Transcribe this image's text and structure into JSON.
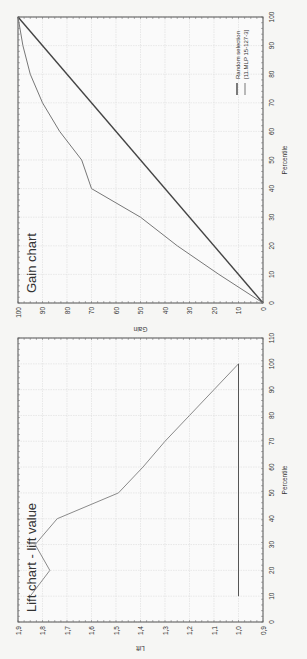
{
  "chart_data": [
    {
      "type": "line",
      "title": "Lift chart - lift value",
      "xlabel": "Percentile",
      "ylabel": "Lift",
      "xlim": [
        0,
        110
      ],
      "ylim": [
        0.9,
        1.9
      ],
      "x_ticks": [
        "0",
        "10",
        "20",
        "30",
        "40",
        "50",
        "60",
        "70",
        "80",
        "90",
        "100",
        "110"
      ],
      "y_ticks": [
        "0,9",
        "1,0",
        "1,1",
        "1,2",
        "1,3",
        "1,4",
        "1,5",
        "1,6",
        "1,7",
        "1,8",
        "1,9"
      ],
      "grid": true,
      "series": [
        {
          "name": "Lift",
          "x": [
            10,
            20,
            30,
            40,
            50,
            60,
            70,
            80,
            90,
            100
          ],
          "y": [
            1.85,
            1.77,
            1.83,
            1.74,
            1.49,
            1.39,
            1.3,
            1.2,
            1.1,
            1.0
          ]
        },
        {
          "name": "Baseline",
          "x": [
            10,
            100
          ],
          "y": [
            1.0,
            1.0
          ]
        }
      ]
    },
    {
      "type": "line",
      "title": "Gain chart",
      "xlabel": "Percentile",
      "ylabel": "Gain",
      "xlim": [
        0,
        100
      ],
      "ylim": [
        0,
        100
      ],
      "x_ticks": [
        "0",
        "10",
        "20",
        "30",
        "40",
        "50",
        "60",
        "70",
        "80",
        "90",
        "100"
      ],
      "y_ticks": [
        "0",
        "10",
        "20",
        "30",
        "40",
        "50",
        "60",
        "70",
        "80",
        "90",
        "100"
      ],
      "grid": true,
      "legend": {
        "position": "lower right",
        "entries": [
          "Random selection",
          "[11.MLP 15-127-3]"
        ]
      },
      "series": [
        {
          "name": "Random selection",
          "x": [
            0,
            100
          ],
          "y": [
            0,
            100
          ]
        },
        {
          "name": "[11.MLP 15-127-3]",
          "x": [
            0,
            10,
            20,
            30,
            40,
            50,
            60,
            70,
            80,
            90,
            100
          ],
          "y": [
            0,
            18,
            35,
            50,
            70,
            74,
            83,
            90,
            95,
            98,
            100
          ]
        }
      ]
    }
  ]
}
